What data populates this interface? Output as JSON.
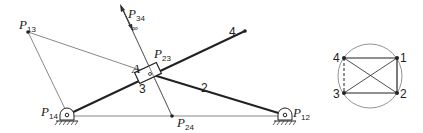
{
  "mechanism": {
    "labels": {
      "p13": {
        "main": "P",
        "sub": "13"
      },
      "p34": {
        "main": "P",
        "sub": "34",
        "extra": "∞"
      },
      "p23": {
        "main": "P",
        "sub": "23"
      },
      "p14": {
        "main": "P",
        "sub": "14"
      },
      "p24": {
        "main": "P",
        "sub": "24"
      },
      "p12": {
        "main": "P",
        "sub": "12"
      },
      "a": "A",
      "link2": "2",
      "link3": "3",
      "link4": "4"
    }
  },
  "circle_diagram": {
    "nodes": [
      "1",
      "2",
      "3",
      "4"
    ]
  },
  "colors": {
    "ink": "#222222",
    "thin_line": "#555555"
  }
}
